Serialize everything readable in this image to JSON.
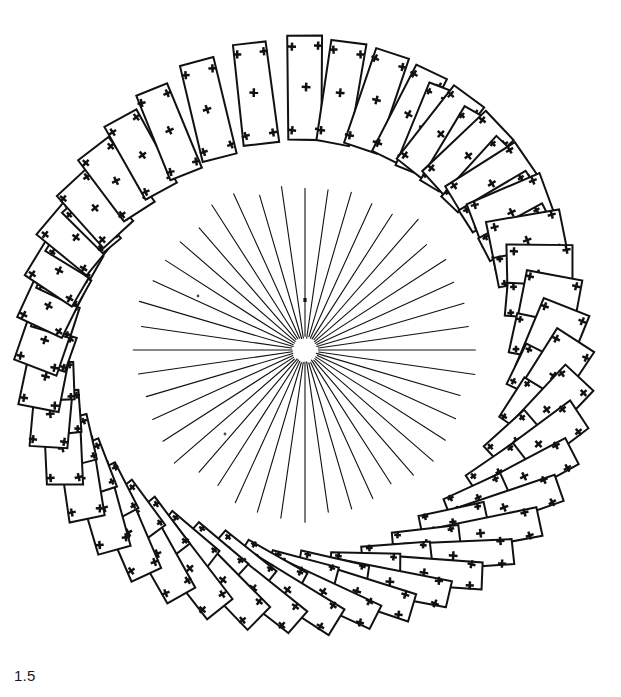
{
  "figure": {
    "title": "",
    "caption_label": "1.5",
    "background_color": "#ffffff",
    "stroke_color": "#111111",
    "canvas": {
      "width": 621,
      "height": 697
    }
  },
  "chart_data": {
    "type": "scatter",
    "title": "",
    "subtitle": "",
    "xlabel": "",
    "ylabel": "",
    "annotations": [
      {
        "text": "1.5",
        "x": 14,
        "y": 668,
        "role": "panel-label"
      }
    ],
    "legend": [],
    "grid": false,
    "xlim": [
      0,
      621
    ],
    "ylim": [
      0,
      697
    ],
    "center": {
      "x": 305,
      "y": 350
    },
    "sunburst": {
      "description": "radial ray bundle emanating from a small blank hub",
      "ray_count": 44,
      "inner_radius": 13,
      "outer_radius": 166,
      "start_angle_deg": 0,
      "stroke_width": 1.1
    },
    "block_ring": {
      "description": "ring of rectangular plates, each marked with plus/cross fiducials at the four corners and at the centroid",
      "count": 44,
      "ring_radius": 252,
      "marker": "plus",
      "series": [
        {
          "name": "plate trajectory",
          "values": [
            {
              "i": 0,
              "angle_deg": -90,
              "r": 262,
              "w": 34,
              "h": 104,
              "rot_deg": 0,
              "shear": 0.0,
              "twin": 0
            },
            {
              "i": 1,
              "angle_deg": -82,
              "r": 260,
              "w": 34,
              "h": 102,
              "rot_deg": 9,
              "shear": 0.02,
              "twin": 0
            },
            {
              "i": 2,
              "angle_deg": -74,
              "r": 259,
              "w": 35,
              "h": 100,
              "rot_deg": 18,
              "shear": 0.03,
              "twin": 0
            },
            {
              "i": 3,
              "angle_deg": -66,
              "r": 257,
              "w": 36,
              "h": 97,
              "rot_deg": 27,
              "shear": 0.04,
              "twin": 1
            },
            {
              "i": 4,
              "angle_deg": -58,
              "r": 255,
              "w": 38,
              "h": 93,
              "rot_deg": 37,
              "shear": 0.05,
              "twin": 1
            },
            {
              "i": 5,
              "angle_deg": -50,
              "r": 253,
              "w": 40,
              "h": 89,
              "rot_deg": 47,
              "shear": 0.06,
              "twin": 1
            },
            {
              "i": 6,
              "angle_deg": -42,
              "r": 251,
              "w": 43,
              "h": 84,
              "rot_deg": 57,
              "shear": 0.07,
              "twin": 1
            },
            {
              "i": 7,
              "angle_deg": -34,
              "r": 249,
              "w": 47,
              "h": 79,
              "rot_deg": 68,
              "shear": 0.08,
              "twin": 1
            },
            {
              "i": 8,
              "angle_deg": -26,
              "r": 248,
              "w": 52,
              "h": 73,
              "rot_deg": 79,
              "shear": 0.08,
              "twin": 1
            },
            {
              "i": 9,
              "angle_deg": -18,
              "r": 247,
              "w": 58,
              "h": 66,
              "rot_deg": 90,
              "shear": 0.07,
              "twin": 1
            },
            {
              "i": 10,
              "angle_deg": -10,
              "r": 247,
              "w": 66,
              "h": 58,
              "rot_deg": 101,
              "shear": 0.06,
              "twin": 1
            },
            {
              "i": 11,
              "angle_deg": -2,
              "r": 248,
              "w": 75,
              "h": 50,
              "rot_deg": 112,
              "shear": 0.05,
              "twin": 1
            },
            {
              "i": 12,
              "angle_deg": 6,
              "r": 249,
              "w": 84,
              "h": 43,
              "rot_deg": 123,
              "shear": 0.04,
              "twin": 1
            },
            {
              "i": 13,
              "angle_deg": 14,
              "r": 250,
              "w": 93,
              "h": 38,
              "rot_deg": 133,
              "shear": 0.03,
              "twin": 1
            },
            {
              "i": 14,
              "angle_deg": 22,
              "r": 252,
              "w": 101,
              "h": 34,
              "rot_deg": 143,
              "shear": 0.02,
              "twin": 1
            },
            {
              "i": 15,
              "angle_deg": 30,
              "r": 253,
              "w": 108,
              "h": 31,
              "rot_deg": 152,
              "shear": 0.01,
              "twin": 1
            },
            {
              "i": 16,
              "angle_deg": 38,
              "r": 254,
              "w": 113,
              "h": 29,
              "rot_deg": 161,
              "shear": 0.0,
              "twin": 1
            },
            {
              "i": 17,
              "angle_deg": 46,
              "r": 254,
              "w": 117,
              "h": 28,
              "rot_deg": 169,
              "shear": 0.0,
              "twin": 1
            },
            {
              "i": 18,
              "angle_deg": 54,
              "r": 253,
              "w": 119,
              "h": 27,
              "rot_deg": 177,
              "shear": 0.0,
              "twin": 1
            },
            {
              "i": 19,
              "angle_deg": 62,
              "r": 251,
              "w": 120,
              "h": 27,
              "rot_deg": 184,
              "shear": 0.0,
              "twin": 1
            },
            {
              "i": 20,
              "angle_deg": 70,
              "r": 248,
              "w": 120,
              "h": 27,
              "rot_deg": 191,
              "shear": 0.0,
              "twin": 1
            },
            {
              "i": 21,
              "angle_deg": 78,
              "r": 245,
              "w": 119,
              "h": 27,
              "rot_deg": 198,
              "shear": 0.0,
              "twin": 1
            },
            {
              "i": 22,
              "angle_deg": 86,
              "r": 243,
              "w": 117,
              "h": 28,
              "rot_deg": 205,
              "shear": 0.0,
              "twin": 1
            },
            {
              "i": 23,
              "angle_deg": 94,
              "r": 242,
              "w": 114,
              "h": 29,
              "rot_deg": 212,
              "shear": 0.0,
              "twin": 1
            },
            {
              "i": 24,
              "angle_deg": 102,
              "r": 243,
              "w": 110,
              "h": 30,
              "rot_deg": 219,
              "shear": 0.0,
              "twin": 1
            },
            {
              "i": 25,
              "angle_deg": 110,
              "r": 245,
              "w": 106,
              "h": 31,
              "rot_deg": 226,
              "shear": 0.0,
              "twin": 1
            },
            {
              "i": 26,
              "angle_deg": 118,
              "r": 248,
              "w": 101,
              "h": 32,
              "rot_deg": 233,
              "shear": 0.0,
              "twin": 1
            },
            {
              "i": 27,
              "angle_deg": 126,
              "r": 251,
              "w": 96,
              "h": 33,
              "rot_deg": 240,
              "shear": 0.0,
              "twin": 1
            },
            {
              "i": 28,
              "angle_deg": 134,
              "r": 254,
              "w": 91,
              "h": 33,
              "rot_deg": 247,
              "shear": 0.0,
              "twin": 1
            },
            {
              "i": 29,
              "angle_deg": 142,
              "r": 257,
              "w": 86,
              "h": 34,
              "rot_deg": 254,
              "shear": 0.0,
              "twin": 1
            },
            {
              "i": 30,
              "angle_deg": 150,
              "r": 259,
              "w": 80,
              "h": 35,
              "rot_deg": 261,
              "shear": 0.0,
              "twin": 1
            },
            {
              "i": 31,
              "angle_deg": 158,
              "r": 261,
              "w": 74,
              "h": 36,
              "rot_deg": 268,
              "shear": 0.0,
              "twin": 1
            },
            {
              "i": 32,
              "angle_deg": 166,
              "r": 262,
              "w": 68,
              "h": 38,
              "rot_deg": 275,
              "shear": 0.01,
              "twin": 1
            },
            {
              "i": 33,
              "angle_deg": 174,
              "r": 262,
              "w": 62,
              "h": 41,
              "rot_deg": 282,
              "shear": 0.02,
              "twin": 1
            },
            {
              "i": 34,
              "angle_deg": -178,
              "r": 261,
              "w": 56,
              "h": 45,
              "rot_deg": 289,
              "shear": 0.03,
              "twin": 1
            },
            {
              "i": 35,
              "angle_deg": -170,
              "r": 259,
              "w": 51,
              "h": 50,
              "rot_deg": 296,
              "shear": 0.04,
              "twin": 1
            },
            {
              "i": 36,
              "angle_deg": -162,
              "r": 257,
              "w": 47,
              "h": 56,
              "rot_deg": 303,
              "shear": 0.04,
              "twin": 1
            },
            {
              "i": 37,
              "angle_deg": -154,
              "r": 255,
              "w": 43,
              "h": 63,
              "rot_deg": 310,
              "shear": 0.04,
              "twin": 1
            },
            {
              "i": 38,
              "angle_deg": -146,
              "r": 254,
              "w": 40,
              "h": 70,
              "rot_deg": 317,
              "shear": 0.03,
              "twin": 0
            },
            {
              "i": 39,
              "angle_deg": -138,
              "r": 254,
              "w": 38,
              "h": 78,
              "rot_deg": 324,
              "shear": 0.03,
              "twin": 0
            },
            {
              "i": 40,
              "angle_deg": -130,
              "r": 255,
              "w": 36,
              "h": 85,
              "rot_deg": 331,
              "shear": 0.02,
              "twin": 0
            },
            {
              "i": 41,
              "angle_deg": -122,
              "r": 257,
              "w": 35,
              "h": 92,
              "rot_deg": 338,
              "shear": 0.02,
              "twin": 0
            },
            {
              "i": 42,
              "angle_deg": -112,
              "r": 259,
              "w": 35,
              "h": 98,
              "rot_deg": 346,
              "shear": 0.01,
              "twin": 0
            },
            {
              "i": 43,
              "angle_deg": -101,
              "r": 261,
              "w": 34,
              "h": 102,
              "rot_deg": 353,
              "shear": 0.0,
              "twin": 0
            }
          ]
        }
      ]
    }
  }
}
